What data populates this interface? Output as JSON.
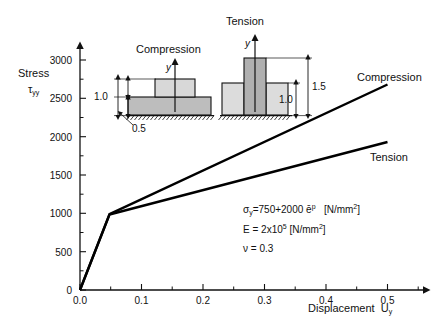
{
  "chart_data": {
    "type": "line",
    "title": "",
    "xlabel": "Displacement  U_y",
    "ylabel": "Stress  τ_yy",
    "xlim": [
      0.0,
      0.56
    ],
    "ylim": [
      0,
      3200
    ],
    "grid": false,
    "legend_position": "inline-right",
    "xticks": [
      0.0,
      0.1,
      0.2,
      0.3,
      0.4,
      0.5
    ],
    "xtick_labels": [
      "0.0",
      "0.1",
      "0.2",
      "0.3",
      "0.4",
      "0.5"
    ],
    "xminor_ticks": [
      0.05,
      0.15,
      0.25,
      0.35,
      0.45,
      0.55
    ],
    "yticks": [
      0,
      500,
      1000,
      1500,
      2000,
      2500,
      3000
    ],
    "ytick_labels": [
      "0",
      "500",
      "1000",
      "1500",
      "2000",
      "2500",
      "3000"
    ],
    "yminor_ticks": [
      250,
      750,
      1250,
      1750,
      2250,
      2750
    ],
    "series": [
      {
        "name": "Compression",
        "x": [
          0.0,
          0.048,
          0.5
        ],
        "values": [
          0,
          990,
          2680
        ]
      },
      {
        "name": "Tension",
        "x": [
          0.0,
          0.048,
          0.5
        ],
        "values": [
          0,
          985,
          1930
        ]
      }
    ]
  },
  "axes": {
    "y_label_line1": "Stress",
    "y_label_line2_symbol": "τ",
    "y_label_line2_sub": "yy",
    "x_label_text": "Displacement",
    "x_label_symbol": "U",
    "x_label_sub": "y"
  },
  "curve_labels": {
    "compression": "Compression",
    "tension": "Tension"
  },
  "insets": {
    "compression": {
      "title": "Compression",
      "axis_label": "y",
      "dim_upper": "1.0",
      "dim_lower": "0.5"
    },
    "tension": {
      "title": "Tension",
      "axis_label": "y",
      "dim_outer": "1.5",
      "dim_inner": "1.0"
    }
  },
  "material": {
    "line1_symbol": "σ",
    "line1_sub": "y",
    "line1_expr": "=750+2000 ",
    "line1_strain": "ē",
    "line1_strain_sup": "p",
    "line1_units_pre": "[N/mm",
    "line1_units_sup": "2",
    "line1_units_post": "]",
    "line2_pre": "E = 2x10",
    "line2_sup": "5",
    "line2_units_pre": " [N/mm",
    "line2_units_sup": "2",
    "line2_units_post": "]",
    "line3": "ν = 0.3"
  },
  "colors": {
    "ink": "#111111",
    "curve": "#000000",
    "block_dark": "#a8a8a8",
    "block_mid": "#c4c4c4",
    "block_light": "#dcdcdc"
  }
}
